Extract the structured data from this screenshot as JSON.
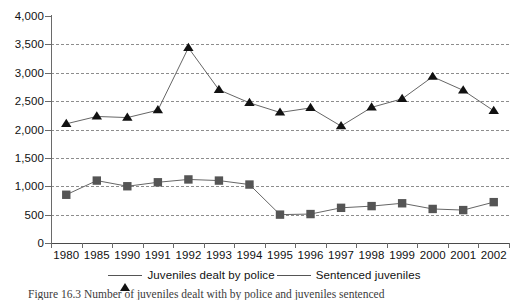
{
  "chart_data": {
    "type": "line",
    "title": "",
    "xlabel": "",
    "ylabel": "",
    "ylim": [
      0,
      4000
    ],
    "ytick_step": 500,
    "grid": true,
    "legend_position": "bottom",
    "categories": [
      "1980",
      "1985",
      "1990",
      "1991",
      "1992",
      "1993",
      "1994",
      "1995",
      "1996",
      "1997",
      "1998",
      "1999",
      "2000",
      "2001",
      "2002"
    ],
    "ytick_labels": [
      "4,000",
      "3,500",
      "3,000",
      "2,500",
      "2,000",
      "1,500",
      "1,000",
      "500",
      "0"
    ],
    "ytick_values": [
      4000,
      3500,
      3000,
      2500,
      2000,
      1500,
      1000,
      500,
      0
    ],
    "series": [
      {
        "name": "Juveniles dealt by police",
        "marker": "triangle",
        "color": "#111111",
        "values": [
          2100,
          2230,
          2210,
          2340,
          3440,
          2700,
          2470,
          2300,
          2380,
          2060,
          2390,
          2540,
          2930,
          2690,
          2330
        ]
      },
      {
        "name": "Sentenced juveniles",
        "marker": "square",
        "color": "#555555",
        "values": [
          850,
          1100,
          1000,
          1070,
          1120,
          1100,
          1030,
          500,
          510,
          620,
          650,
          700,
          600,
          580,
          720
        ]
      }
    ]
  },
  "legend": {
    "entries": [
      {
        "label": "Juveniles dealt by police"
      },
      {
        "label": "Sentenced juveniles"
      }
    ]
  },
  "caption": {
    "text": "Figure 16.3  Number of juveniles dealt with by police and juveniles sentenced"
  }
}
